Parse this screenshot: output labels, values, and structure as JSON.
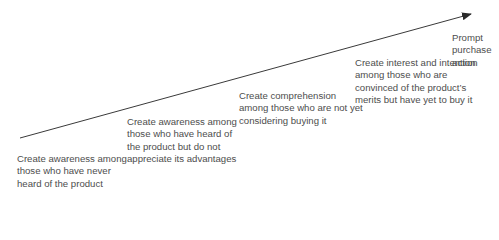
{
  "diagram": {
    "type": "progression-arrow",
    "stages": [
      {
        "text": "Create awareness among those who have never heard of the product"
      },
      {
        "text": "Create awareness among those who have heard of the product but do not appreciate its advantages"
      },
      {
        "text": "Create comprehension among those who are not yet considering buying it"
      },
      {
        "text": "Create interest and intention among those who are convinced of the product’s merits but have yet to buy it"
      },
      {
        "text": "Prompt purchase action"
      }
    ],
    "colors": {
      "line": "#3a3a3a",
      "text": "#4d4d4d"
    }
  }
}
